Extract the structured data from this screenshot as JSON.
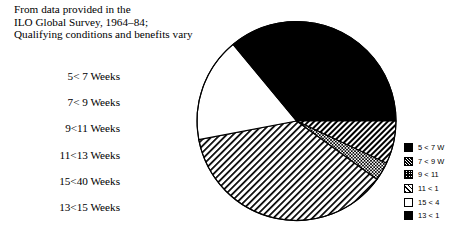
{
  "header": {
    "lines": [
      "From data provided in the",
      "ILO Global Survey, 1964–84;",
      "Qualifying conditions and benefits vary"
    ]
  },
  "categories": [
    {
      "label": "5<  7 Weeks"
    },
    {
      "label": "7<  9 Weeks"
    },
    {
      "label": "9<11 Weeks"
    },
    {
      "label": "11<13 Weeks"
    },
    {
      "label": "15<40 Weeks"
    },
    {
      "label": "13<15 Weeks"
    }
  ],
  "legend": {
    "position": "right",
    "entries": [
      {
        "label": "5 < 7 W",
        "pattern": "solid-black",
        "swatch_class": "sw-solid"
      },
      {
        "label": "7 < 9 W",
        "pattern": "dense-diagonal-hatch",
        "swatch_class": "sw-hatch-dense"
      },
      {
        "label": "9 < 11",
        "pattern": "checkered",
        "swatch_class": "sw-checker"
      },
      {
        "label": "11 < 1",
        "pattern": "light-diagonal-hatch",
        "swatch_class": "sw-hatch-light"
      },
      {
        "label": "15 < 4",
        "pattern": "white",
        "swatch_class": "sw-white"
      },
      {
        "label": "13 < 1",
        "pattern": "solid-black",
        "swatch_class": "sw-solid"
      }
    ]
  },
  "chart_data": {
    "type": "pie",
    "title": "",
    "subtitle": "From data provided in the ILO Global Survey, 1964–84; Qualifying conditions and benefits vary",
    "start_angle_deg": 0,
    "direction": "clockwise",
    "center": {
      "x": 113.5,
      "y": 113.0
    },
    "radius": 99.5,
    "units": "percent",
    "categories": [
      "5 < 7 Weeks",
      "7 < 9 Weeks",
      "9 < 11 Weeks",
      "11 < 13 Weeks",
      "15 < 40 Weeks",
      "13 < 15 Weeks"
    ],
    "values": [
      25.0,
      7.0,
      3.0,
      37.0,
      17.0,
      11.0
    ],
    "fills": [
      "solid-black",
      "dense-diagonal-hatch",
      "checkered",
      "light-diagonal-hatch",
      "white",
      "solid-black"
    ],
    "legend_labels": [
      "5 < 7 W",
      "7 < 9 W",
      "9 < 11",
      "11 < 1",
      "15 < 4",
      "13 < 1"
    ],
    "grid": false,
    "stroke_color": "#000000"
  },
  "colors": {
    "background": "#ffffff",
    "ink": "#000000"
  }
}
